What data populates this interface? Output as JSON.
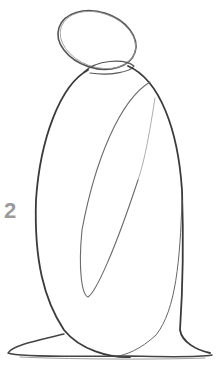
{
  "image": {
    "description": "Pencil sketch, step 2 of a figure drawing tutorial: oval head atop a tall rounded robed body with an inner draped fold and flared base",
    "step_label": "2",
    "colors": {
      "background": "#ffffff",
      "pencil_dark": "#3a3a3a",
      "pencil_light": "#8a8a8a",
      "label": "#9a9a9a"
    }
  }
}
